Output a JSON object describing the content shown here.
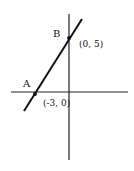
{
  "diagram": {
    "type": "coordinate-plane-line",
    "points": [
      {
        "name": "A",
        "coord_label": "(-3, 0)"
      },
      {
        "name": "B",
        "coord_label": "(0, 5)"
      }
    ]
  }
}
